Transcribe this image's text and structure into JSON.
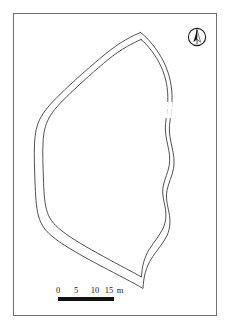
{
  "figure": {
    "kind": "archaeological-site-plan",
    "background_color": "#ffffff",
    "frame": {
      "stroke_color": "#6e6e70",
      "stroke_width": 1,
      "x": 13,
      "y": 13,
      "width": 204,
      "height": 303
    }
  },
  "north_arrow": {
    "label": "N",
    "style": "circle-with-half-filled-needle",
    "stroke_color": "#1a1a1a",
    "fill_color": "#1a1a1a",
    "x": 187,
    "y": 27,
    "size": 20
  },
  "scale_bar": {
    "labels": [
      "0",
      "5",
      "10",
      "15"
    ],
    "unit": "m",
    "full_text": "0 5 10 15m",
    "segments": [
      {
        "from": "0",
        "to": "5",
        "fill": "dark"
      },
      {
        "from": "5",
        "to": "10",
        "fill": "dark"
      },
      {
        "from": "10",
        "to": "15",
        "fill": "dark"
      }
    ],
    "tick_positions_px": [
      0,
      18,
      37,
      56
    ],
    "bar_color": "#111111",
    "length_px": 56,
    "represents_meters": 15
  },
  "map_features": {
    "outline_stroke_color": "#3d3d3f",
    "outline_stroke_width": 0.9,
    "outer_contour_path": "M 140.5 32.5 C 148 38 158 50 164.0 62.5 C 170 75 172.5 88 172.0 100.5 C 171.6 110 170.2 118 169.5 125.5 C 168.8 133 170.5 140 172.0 147.0 C 173.6 154 174.8 161 173.5 168.5 C 172.2 176 168.5 183 167.0 190.5 C 165.5 198 167.5 205 169.0 212.5 C 170.5 220 170.5 228 167.0 235.5 C 163.5 243 157 250 151.5 258.5 C 146 267 143.5 277 143.0 288.5 C 134 283 118 275 101 266 C 84 257 66 247 55.5 239.0 C 45 231 41 225 38.5 216.0 C 36 207 35.5 195 35.0 182.0 C 34.5 169 34.0 155 34.5 144.0 C 35.0 133 36.5 125 41.0 117.0 C 45.5 109 53 101 64.5 90.0 C 76 79 92 65 106.0 53.5 C 120 42 132 36 140.5 32.5 Z",
    "inner_contour_path": "M 141.0 39.5 C 147.5 44.5 156 55.5 161.0 66.5 C 166 77.5 168.2 89 167.8 100.5 C 167.5 109.5 166.2 117 165.5 124.5 C 164.8 132 166.4 139 167.8 145.5 C 169.3 152 170.4 158.5 169.2 165.5 C 168.0 172.5 164.6 179 163.2 186.0 C 161.8 193 163.6 199.5 165.0 206.5 C 166.4 213.5 166.4 221 163.2 228.0 C 160.0 235 154.2 241.5 149.2 249.5 C 144.2 257.5 141.9 266.5 141.5 277.0 C 133.5 272.5 119 265 103.5 256.5 C 88 248 71.5 238.5 62.0 231.0 C 52.5 223.5 48.8 218 46.5 209.5 C 44.2 201 43.8 190 43.4 178.0 C 43.0 166 42.5 153 43.0 143.0 C 43.5 133 44.9 125.5 49.0 118.0 C 53.1 110.5 60 103 70.5 93.0 C 81 83 95.5 70 108.2 59.5 C 121 49 133 43 141.0 39.5 Z",
    "dashed_gap": {
      "present": true,
      "path": "M 171.3 103.0 L 170.0 118.0",
      "inner_path": "M 167.1 103.0 L 165.9 118.0",
      "dash_pattern": "2,2"
    }
  }
}
